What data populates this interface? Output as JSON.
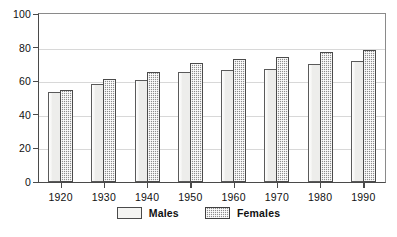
{
  "chart_data": {
    "type": "bar",
    "title": "",
    "subtitle": "",
    "xlabel": "",
    "ylabel": "",
    "categories": [
      "1920",
      "1930",
      "1940",
      "1950",
      "1960",
      "1970",
      "1980",
      "1990"
    ],
    "series": [
      {
        "name": "Males",
        "color": "#ededeb",
        "values": [
          53.6,
          58.1,
          60.8,
          65.6,
          66.6,
          67.1,
          70.0,
          71.8
        ]
      },
      {
        "name": "Females",
        "color": "#8e8e8e",
        "values": [
          54.6,
          61.6,
          65.2,
          71.1,
          73.1,
          74.7,
          77.4,
          78.8
        ]
      }
    ],
    "ylim": [
      0,
      100
    ],
    "yticks": [
      0,
      20,
      40,
      60,
      80,
      100
    ],
    "ytick_labels": [
      "0",
      "20",
      "40",
      "60",
      "80",
      "100"
    ],
    "grid": true,
    "grid_axis": "y",
    "legend_position": "bottom-center",
    "legend_entries": [
      "Males",
      "Females"
    ]
  },
  "legend": {
    "males_label": "Males",
    "females_label": "Females"
  },
  "icons": {
    "males_swatch": "legend-swatch-light",
    "females_swatch": "legend-swatch-hatched"
  }
}
